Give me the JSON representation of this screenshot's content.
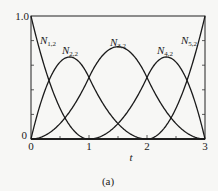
{
  "chart_data": {
    "type": "line",
    "title": "",
    "caption": "(a)",
    "xlabel": "t",
    "ylabel": "",
    "xlim": [
      0,
      3
    ],
    "ylim": [
      0,
      1
    ],
    "x_ticks": [
      0,
      1,
      2,
      3
    ],
    "x_tick_labels": [
      "0",
      "1",
      "2",
      "3"
    ],
    "x_minor_ticks": [
      0.5,
      1.5,
      2.5
    ],
    "y_ticks": [
      0,
      1.0
    ],
    "y_tick_labels": [
      "0",
      "1.0"
    ],
    "y_minor_ticks": [
      0.2,
      0.4,
      0.6,
      0.8
    ],
    "grid": false,
    "legend": "inline curve labels",
    "knot_vector": [
      0,
      0,
      0,
      1,
      2,
      3,
      3,
      3
    ],
    "series": [
      {
        "name": "N1,2",
        "label_base": "N",
        "label_sub": "1,2",
        "x": [
          0,
          0.5,
          1,
          1.5,
          2,
          2.5,
          3
        ],
        "values": [
          1.0,
          0.25,
          0,
          0,
          0,
          0,
          0
        ]
      },
      {
        "name": "N2,2",
        "label_base": "N",
        "label_sub": "2,2",
        "x": [
          0,
          0.5,
          0.667,
          1,
          1.5,
          2,
          2.5,
          3
        ],
        "values": [
          0,
          0.625,
          0.667,
          0.5,
          0.125,
          0,
          0,
          0
        ]
      },
      {
        "name": "N3,2",
        "label_base": "N",
        "label_sub": "3,2",
        "x": [
          0,
          0.5,
          1,
          1.5,
          2,
          2.5,
          3
        ],
        "values": [
          0,
          0.125,
          0.5,
          0.75,
          0.5,
          0.125,
          0
        ]
      },
      {
        "name": "N4,2",
        "label_base": "N",
        "label_sub": "4,2",
        "x": [
          0,
          0.5,
          1,
          1.5,
          2,
          2.333,
          2.5,
          3
        ],
        "values": [
          0,
          0,
          0,
          0.125,
          0.5,
          0.667,
          0.625,
          0
        ]
      },
      {
        "name": "N5,2",
        "label_base": "N",
        "label_sub": "5,2",
        "x": [
          0,
          0.5,
          1,
          1.5,
          2,
          2.5,
          3
        ],
        "values": [
          0,
          0,
          0,
          0,
          0,
          0.25,
          1.0
        ]
      }
    ]
  },
  "labels": {
    "y_top": "1.0",
    "y_bottom": "0",
    "x_ticks": [
      "0",
      "1",
      "2",
      "3"
    ],
    "x_axis": "t",
    "caption": "(a)",
    "curves": [
      {
        "base": "N",
        "sub": "1,2"
      },
      {
        "base": "N",
        "sub": "2,2"
      },
      {
        "base": "N",
        "sub": "3,2"
      },
      {
        "base": "N",
        "sub": "4,2"
      },
      {
        "base": "N",
        "sub": "5,2"
      }
    ]
  }
}
